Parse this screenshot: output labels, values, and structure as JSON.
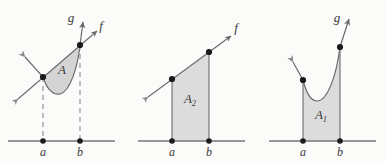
{
  "figure": {
    "name": "area-between-curves-figure",
    "background_color": "#fbfbfa",
    "width": 385,
    "height": 164,
    "curve_color": "#6b6b6b",
    "fill_color": "#d6d6d6",
    "fill_color_alt": "#dcdcdc",
    "axis_color": "#777777",
    "point_color": "#1a1a1a",
    "label_color": "#3a3a3a",
    "dash_color": "#8c8c8c"
  },
  "panels": [
    {
      "id": "panel-1",
      "region_label": "A",
      "function_labels": [
        "g",
        "f"
      ],
      "bound_left": "a",
      "bound_right": "b",
      "vertical_style": "dashed",
      "description": "lens-shaped region between line f and curve g",
      "axis_y": 141,
      "x_a": 43,
      "x_b": 80
    },
    {
      "id": "panel-2",
      "region_label": "A",
      "region_sub": "2",
      "function_labels": [
        "f"
      ],
      "bound_left": "a",
      "bound_right": "b",
      "vertical_style": "solid",
      "description": "trapezoid under straight line f",
      "axis_y": 141,
      "x_a": 172,
      "x_b": 209
    },
    {
      "id": "panel-3",
      "region_label": "A",
      "region_sub": "1",
      "function_labels": [
        "g"
      ],
      "bound_left": "a",
      "bound_right": "b",
      "vertical_style": "solid",
      "description": "region under U-shaped curve g",
      "axis_y": 141,
      "x_a": 303,
      "x_b": 340
    }
  ]
}
